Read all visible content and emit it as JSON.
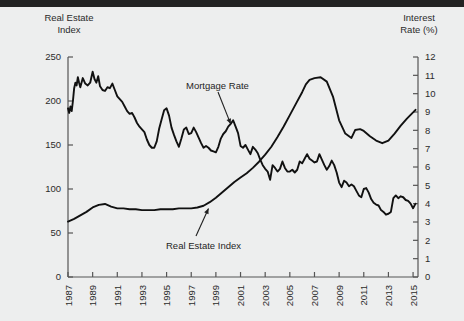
{
  "figure": {
    "background_color": "#edeeee",
    "top_band_color": "#232323",
    "line_color": "#111111",
    "axis_color": "#555555",
    "text_color": "#2b2b2b"
  },
  "labels": {
    "left_axis_title": "Real Estate\nIndex",
    "right_axis_title": "Interest\nRate (%)",
    "annotation_mortgage": "Mortgage Rate",
    "annotation_index": "Real Estate Index"
  },
  "chart_data": {
    "type": "line",
    "title": "",
    "xlabel": "",
    "ylabel": "Real Estate Index",
    "y2label": "Interest Rate (%)",
    "grid": false,
    "legend": "annotations-with-arrows",
    "xlim": [
      1987,
      2015.4
    ],
    "ylim": [
      0,
      250
    ],
    "y2lim": [
      0,
      12
    ],
    "xticks": [
      1987,
      1989,
      1991,
      1993,
      1995,
      1997,
      1999,
      2001,
      2003,
      2005,
      2007,
      2009,
      2011,
      2013,
      2015
    ],
    "xtick_labels": [
      "1987",
      "1989",
      "1991",
      "1993",
      "1995",
      "1997",
      "1999",
      "2001",
      "2003",
      "2005",
      "2007",
      "2009",
      "2011",
      "2013",
      "2015"
    ],
    "xtick_rotation": 90,
    "yticks": [
      0,
      50,
      100,
      150,
      200,
      250
    ],
    "ytick_labels": [
      "0",
      "50",
      "100",
      "150",
      "200",
      "250"
    ],
    "y2ticks": [
      0,
      1,
      2,
      3,
      4,
      5,
      6,
      7,
      8,
      9,
      10,
      11,
      12
    ],
    "y2tick_labels": [
      "0",
      "1",
      "2",
      "3",
      "4",
      "5",
      "6",
      "7",
      "8",
      "9",
      "10",
      "11",
      "12"
    ],
    "minor_xticks_per_interval": 2,
    "series": [
      {
        "name": "Mortgage Rate",
        "axis": "right",
        "unit": "%",
        "x": [
          1987.0,
          1987.1,
          1987.2,
          1987.3,
          1987.4,
          1987.5,
          1987.6,
          1987.7,
          1987.8,
          1987.9,
          1988.0,
          1988.2,
          1988.4,
          1988.6,
          1988.8,
          1989.0,
          1989.15,
          1989.3,
          1989.45,
          1989.6,
          1989.8,
          1990.0,
          1990.2,
          1990.4,
          1990.6,
          1990.8,
          1991.0,
          1991.2,
          1991.4,
          1991.6,
          1991.8,
          1992.0,
          1992.2,
          1992.4,
          1992.6,
          1992.8,
          1993.0,
          1993.2,
          1993.4,
          1993.6,
          1993.8,
          1994.0,
          1994.2,
          1994.4,
          1994.6,
          1994.8,
          1995.0,
          1995.2,
          1995.4,
          1995.6,
          1995.8,
          1996.0,
          1996.2,
          1996.4,
          1996.6,
          1996.8,
          1997.0,
          1997.2,
          1997.4,
          1997.6,
          1997.8,
          1998.0,
          1998.2,
          1998.4,
          1998.6,
          1998.8,
          1999.0,
          1999.2,
          1999.4,
          1999.6,
          1999.8,
          2000.0,
          2000.2,
          2000.4,
          2000.6,
          2000.8,
          2001.0,
          2001.2,
          2001.4,
          2001.6,
          2001.8,
          2002.0,
          2002.2,
          2002.4,
          2002.6,
          2002.8,
          2003.0,
          2003.2,
          2003.4,
          2003.6,
          2003.8,
          2004.0,
          2004.2,
          2004.4,
          2004.6,
          2004.8,
          2005.0,
          2005.2,
          2005.4,
          2005.6,
          2005.8,
          2006.0,
          2006.2,
          2006.4,
          2006.6,
          2006.8,
          2007.0,
          2007.2,
          2007.4,
          2007.6,
          2007.8,
          2008.0,
          2008.2,
          2008.4,
          2008.6,
          2008.8,
          2009.0,
          2009.2,
          2009.4,
          2009.6,
          2009.8,
          2010.0,
          2010.2,
          2010.4,
          2010.6,
          2010.8,
          2011.0,
          2011.2,
          2011.4,
          2011.6,
          2011.8,
          2012.0,
          2012.2,
          2012.4,
          2012.6,
          2012.8,
          2013.0,
          2013.2,
          2013.4,
          2013.6,
          2013.8,
          2014.0,
          2014.2,
          2014.4,
          2014.6,
          2014.8,
          2015.0,
          2015.2
        ],
        "y": [
          9.2,
          8.95,
          9.3,
          9.05,
          9.6,
          10.3,
          10.6,
          10.45,
          10.9,
          10.6,
          10.35,
          10.85,
          10.55,
          10.45,
          10.6,
          11.2,
          10.8,
          10.6,
          10.95,
          10.4,
          10.2,
          10.15,
          10.35,
          10.3,
          10.55,
          10.2,
          9.85,
          9.7,
          9.55,
          9.3,
          9.05,
          8.9,
          8.95,
          8.7,
          8.4,
          8.2,
          8.05,
          7.9,
          7.5,
          7.2,
          7.05,
          7.05,
          7.4,
          8.1,
          8.6,
          9.1,
          9.2,
          8.8,
          8.15,
          7.75,
          7.4,
          7.1,
          7.55,
          8.05,
          8.15,
          7.8,
          7.85,
          8.15,
          7.9,
          7.6,
          7.3,
          7.05,
          7.15,
          7.05,
          6.9,
          6.85,
          6.8,
          7.1,
          7.55,
          7.8,
          7.95,
          8.2,
          8.35,
          8.55,
          8.2,
          7.85,
          7.15,
          7.05,
          7.2,
          6.95,
          6.7,
          7.1,
          6.95,
          6.75,
          6.4,
          6.1,
          5.9,
          5.75,
          5.3,
          6.1,
          5.95,
          5.75,
          5.9,
          6.3,
          5.95,
          5.75,
          5.75,
          5.85,
          5.7,
          5.85,
          6.3,
          6.2,
          6.45,
          6.7,
          6.45,
          6.35,
          6.25,
          6.3,
          6.7,
          6.4,
          6.1,
          5.85,
          6.05,
          6.35,
          6.1,
          5.7,
          5.15,
          4.9,
          5.25,
          5.15,
          4.95,
          5.05,
          4.95,
          4.7,
          4.45,
          4.35,
          4.8,
          4.85,
          4.6,
          4.25,
          4.05,
          3.95,
          3.9,
          3.65,
          3.55,
          3.4,
          3.45,
          3.55,
          4.3,
          4.45,
          4.3,
          4.4,
          4.35,
          4.2,
          4.15,
          4.0,
          3.75,
          4.0
        ]
      },
      {
        "name": "Real Estate Index",
        "axis": "left",
        "unit": "index",
        "x": [
          1987.0,
          1987.5,
          1988.0,
          1988.5,
          1989.0,
          1989.5,
          1990.0,
          1990.5,
          1991.0,
          1991.5,
          1992.0,
          1992.5,
          1993.0,
          1993.5,
          1994.0,
          1994.5,
          1995.0,
          1995.5,
          1996.0,
          1996.5,
          1997.0,
          1997.5,
          1998.0,
          1998.5,
          1999.0,
          1999.5,
          2000.0,
          2000.5,
          2001.0,
          2001.5,
          2002.0,
          2002.5,
          2003.0,
          2003.5,
          2004.0,
          2004.5,
          2005.0,
          2005.5,
          2006.0,
          2006.3,
          2006.6,
          2007.0,
          2007.5,
          2008.0,
          2008.5,
          2009.0,
          2009.5,
          2010.0,
          2010.3,
          2010.7,
          2011.0,
          2011.5,
          2012.0,
          2012.5,
          2013.0,
          2013.5,
          2014.0,
          2014.5,
          2015.0,
          2015.2
        ],
        "y": [
          63,
          66,
          70,
          74,
          79,
          82,
          83,
          80,
          78,
          78,
          77,
          77,
          76,
          76,
          76,
          77,
          77,
          77,
          78,
          78,
          78,
          79,
          81,
          85,
          90,
          96,
          102,
          108,
          113,
          118,
          124,
          131,
          139,
          148,
          159,
          171,
          184,
          197,
          210,
          219,
          224,
          226,
          227,
          222,
          205,
          178,
          163,
          158,
          167,
          168,
          166,
          160,
          155,
          152,
          155,
          163,
          172,
          180,
          187,
          190
        ]
      }
    ],
    "annotations": [
      {
        "text": "Mortgage Rate",
        "points_to_series": "Mortgage Rate",
        "at_x": 2000.2,
        "at_y_pct": 8.35
      },
      {
        "text": "Real Estate Index",
        "points_to_series": "Real Estate Index",
        "at_x": 1998.4,
        "at_y_index": 80
      }
    ]
  }
}
